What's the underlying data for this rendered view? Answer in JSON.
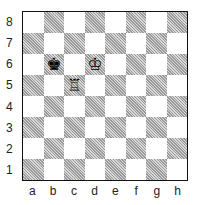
{
  "board": {
    "files": [
      "a",
      "b",
      "c",
      "d",
      "e",
      "f",
      "g",
      "h"
    ],
    "ranks": [
      "8",
      "7",
      "6",
      "5",
      "4",
      "3",
      "2",
      "1"
    ],
    "pieces": [
      {
        "square": "b6",
        "piece": "black-king",
        "glyph": "♚"
      },
      {
        "square": "d6",
        "piece": "white-king",
        "glyph": "♔"
      },
      {
        "square": "c5",
        "piece": "white-rook",
        "glyph": "♖"
      }
    ]
  }
}
